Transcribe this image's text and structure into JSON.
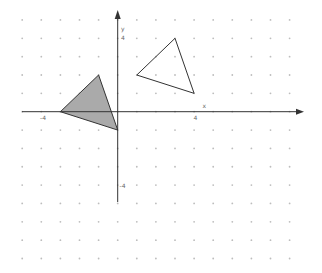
{
  "diagram": {
    "type": "coordinate-grid-translation",
    "axes": {
      "x_label": "x",
      "y_label": "y",
      "x_range": [
        -5,
        9
      ],
      "y_range": [
        -8,
        5
      ],
      "tick_labels": [
        {
          "axis": "x",
          "value": -4,
          "text": "-4"
        },
        {
          "axis": "x",
          "value": 4,
          "text": "4"
        },
        {
          "axis": "y",
          "value": 4,
          "text": "4"
        },
        {
          "axis": "y",
          "value": -4,
          "text": "-4"
        }
      ],
      "grid": "dots",
      "color": "#333333"
    },
    "shapes": [
      {
        "name": "preimage-triangle",
        "vertices": [
          [
            1,
            2
          ],
          [
            3,
            4
          ],
          [
            4,
            1
          ]
        ],
        "fill": "none",
        "stroke": "#333333"
      },
      {
        "name": "image-triangle",
        "vertices": [
          [
            -3,
            0
          ],
          [
            -1,
            2
          ],
          [
            0,
            -1
          ]
        ],
        "fill": "#aaaaaa",
        "stroke": "#333333"
      }
    ]
  }
}
